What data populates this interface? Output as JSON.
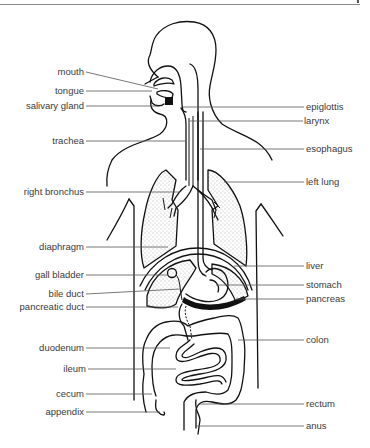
{
  "diagram": {
    "left_labels": [
      {
        "id": "mouth",
        "text": "mouth"
      },
      {
        "id": "tongue",
        "text": "tongue"
      },
      {
        "id": "salivary_gland",
        "text": "salivary gland"
      },
      {
        "id": "trachea",
        "text": "trachea"
      },
      {
        "id": "right_bronchus",
        "text": "right bronchus"
      },
      {
        "id": "diaphragm",
        "text": "diaphragm"
      },
      {
        "id": "gall_bladder",
        "text": "gall bladder"
      },
      {
        "id": "bile_duct",
        "text": "bile duct"
      },
      {
        "id": "pancreatic_duct",
        "text": "pancreatic duct"
      },
      {
        "id": "duodenum",
        "text": "duodenum"
      },
      {
        "id": "ileum",
        "text": "ileum"
      },
      {
        "id": "cecum",
        "text": "cecum"
      },
      {
        "id": "appendix",
        "text": "appendix"
      }
    ],
    "right_labels": [
      {
        "id": "epiglottis",
        "text": "epiglottis"
      },
      {
        "id": "larynx",
        "text": "larynx"
      },
      {
        "id": "esophagus",
        "text": "esophagus"
      },
      {
        "id": "left_lung",
        "text": "left lung"
      },
      {
        "id": "liver",
        "text": "liver"
      },
      {
        "id": "stomach",
        "text": "stomach"
      },
      {
        "id": "pancreas",
        "text": "pancreas"
      },
      {
        "id": "colon",
        "text": "colon"
      },
      {
        "id": "rectum",
        "text": "rectum"
      },
      {
        "id": "anus",
        "text": "anus"
      }
    ]
  }
}
